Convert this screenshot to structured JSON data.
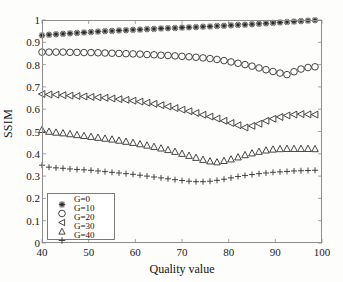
{
  "chart_data": {
    "type": "scatter",
    "title": "",
    "xlabel": "Quality value",
    "ylabel": "SSIM",
    "xlim": [
      40,
      100
    ],
    "ylim": [
      0,
      1
    ],
    "xticks": [
      40,
      50,
      60,
      70,
      80,
      90,
      100
    ],
    "yticks": [
      0,
      0.1,
      0.2,
      0.3,
      0.4,
      0.5,
      0.6,
      0.7,
      0.8,
      0.9,
      1
    ],
    "grid": false,
    "legend_position": "lower-left",
    "x": [
      40,
      41.5,
      43,
      44.5,
      46,
      47.5,
      49,
      50.5,
      52,
      53.5,
      55,
      56.5,
      58,
      59.5,
      61,
      62.5,
      64,
      65.5,
      67,
      68.5,
      70,
      71.5,
      73,
      74.5,
      76,
      77.5,
      79,
      80.5,
      82,
      83.5,
      85,
      86.5,
      88,
      89.5,
      91,
      92.5,
      94,
      95.5,
      97,
      98.5
    ],
    "series": [
      {
        "name": "G=0",
        "marker": "star",
        "values": [
          0.931,
          0.934,
          0.936,
          0.938,
          0.94,
          0.942,
          0.944,
          0.946,
          0.948,
          0.95,
          0.951,
          0.953,
          0.954,
          0.956,
          0.957,
          0.959,
          0.96,
          0.962,
          0.963,
          0.964,
          0.966,
          0.967,
          0.968,
          0.97,
          0.971,
          0.973,
          0.974,
          0.976,
          0.978,
          0.979,
          0.981,
          0.983,
          0.985,
          0.987,
          0.989,
          0.991,
          0.993,
          0.995,
          0.997,
          0.999
        ]
      },
      {
        "name": "G=10",
        "marker": "circle",
        "values": [
          0.856,
          0.856,
          0.856,
          0.856,
          0.855,
          0.855,
          0.854,
          0.854,
          0.853,
          0.852,
          0.851,
          0.85,
          0.849,
          0.848,
          0.847,
          0.845,
          0.844,
          0.842,
          0.841,
          0.839,
          0.837,
          0.835,
          0.833,
          0.83,
          0.827,
          0.823,
          0.818,
          0.812,
          0.806,
          0.8,
          0.793,
          0.785,
          0.777,
          0.769,
          0.762,
          0.755,
          0.768,
          0.78,
          0.787,
          0.79
        ]
      },
      {
        "name": "G=20",
        "marker": "triangle-left",
        "values": [
          0.668,
          0.666,
          0.665,
          0.663,
          0.661,
          0.659,
          0.657,
          0.655,
          0.653,
          0.651,
          0.648,
          0.645,
          0.642,
          0.638,
          0.634,
          0.629,
          0.624,
          0.618,
          0.612,
          0.605,
          0.598,
          0.591,
          0.583,
          0.575,
          0.567,
          0.558,
          0.548,
          0.538,
          0.528,
          0.518,
          0.525,
          0.535,
          0.548,
          0.557,
          0.565,
          0.572,
          0.576,
          0.578,
          0.577,
          0.576
        ]
      },
      {
        "name": "G=30",
        "marker": "triangle-up",
        "values": [
          0.508,
          0.5,
          0.496,
          0.493,
          0.489,
          0.485,
          0.481,
          0.477,
          0.473,
          0.469,
          0.465,
          0.46,
          0.455,
          0.45,
          0.444,
          0.438,
          0.432,
          0.425,
          0.418,
          0.41,
          0.401,
          0.392,
          0.383,
          0.374,
          0.367,
          0.363,
          0.369,
          0.376,
          0.385,
          0.395,
          0.403,
          0.41,
          0.416,
          0.42,
          0.422,
          0.423,
          0.423,
          0.423,
          0.423,
          0.422
        ]
      },
      {
        "name": "G=40",
        "marker": "plus",
        "values": [
          0.349,
          0.34,
          0.337,
          0.335,
          0.332,
          0.33,
          0.328,
          0.326,
          0.323,
          0.32,
          0.317,
          0.314,
          0.311,
          0.308,
          0.304,
          0.3,
          0.296,
          0.292,
          0.288,
          0.284,
          0.28,
          0.277,
          0.275,
          0.275,
          0.277,
          0.281,
          0.286,
          0.292,
          0.298,
          0.303,
          0.307,
          0.311,
          0.314,
          0.317,
          0.319,
          0.321,
          0.323,
          0.324,
          0.325,
          0.326
        ]
      }
    ]
  },
  "axes": {
    "ylabel": "SSIM",
    "xlabel": "Quality value"
  },
  "legend": {
    "entries": [
      {
        "label": "G=0",
        "marker": "star"
      },
      {
        "label": "G=10",
        "marker": "circle"
      },
      {
        "label": "G=20",
        "marker": "triangle-left"
      },
      {
        "label": "G=30",
        "marker": "triangle-up"
      },
      {
        "label": "G=40",
        "marker": "plus"
      }
    ]
  },
  "colors": {
    "marker": "#262626",
    "frame": "#8d8d8d",
    "text": "#111111",
    "background": "#fdfdfc"
  }
}
